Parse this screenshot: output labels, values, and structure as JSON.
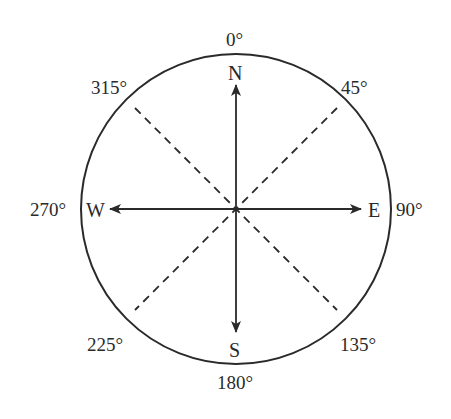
{
  "diagram": {
    "colors": {
      "stroke": "#2a2a2a",
      "background": "#ffffff"
    },
    "cardinals": {
      "north": "N",
      "east": "E",
      "south": "S",
      "west": "W"
    },
    "bearings": {
      "b0": "0°",
      "b45": "45°",
      "b90": "90°",
      "b135": "135°",
      "b180": "180°",
      "b225": "225°",
      "b270": "270°",
      "b315": "315°"
    }
  }
}
